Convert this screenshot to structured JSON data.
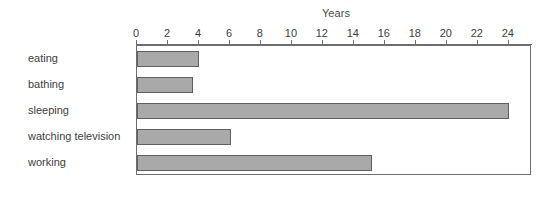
{
  "chart_data": {
    "type": "bar",
    "orientation": "horizontal",
    "title": "",
    "xlabel": "Years",
    "ylabel": "",
    "categories": [
      "eating",
      "bathing",
      "sleeping",
      "watching television",
      "working"
    ],
    "values": [
      4.0,
      3.6,
      24.0,
      6.1,
      15.2
    ],
    "xlim": [
      0,
      25.5
    ],
    "xticks": [
      0,
      2,
      4,
      6,
      8,
      10,
      12,
      14,
      16,
      18,
      20,
      22,
      24
    ],
    "xtick_labels": [
      "0",
      "2",
      "4",
      "6",
      "8",
      "10",
      "12",
      "14",
      "16",
      "18",
      "20",
      "22",
      "24"
    ],
    "grid": false,
    "legend": null,
    "bar_fill_color": "#a9a9a9",
    "bar_edge_color": "#5f5f5f",
    "frame_color": "#6d6d6d",
    "axis_position": "top"
  }
}
